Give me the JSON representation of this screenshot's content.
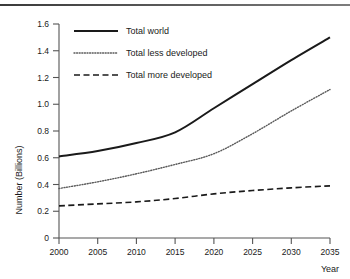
{
  "figure": {
    "has_top_rule": true,
    "background_color": "#ffffff",
    "ink_color": "#1a1a1a"
  },
  "chart_data": {
    "type": "line",
    "title": "",
    "xlabel": "Year",
    "ylabel": "Number (Billions)",
    "x": [
      2000,
      2005,
      2010,
      2015,
      2020,
      2025,
      2030,
      2035
    ],
    "xlim": [
      2000,
      2035
    ],
    "ylim": [
      0,
      1.6
    ],
    "xticks": [
      2000,
      2005,
      2010,
      2015,
      2020,
      2025,
      2030,
      2035
    ],
    "xtick_labels": [
      "2000",
      "2005",
      "2010",
      "2015",
      "2020",
      "2025",
      "2030",
      "2035"
    ],
    "yticks": [
      0,
      0.2,
      0.4,
      0.6,
      0.8,
      1.0,
      1.2,
      1.4,
      1.6
    ],
    "ytick_labels": [
      "0",
      "0.2",
      "0.4",
      "0.6",
      "0.8",
      "1.0",
      "1.2",
      "1.4",
      "1.6"
    ],
    "grid": false,
    "legend_position": "top-left-inside",
    "series": [
      {
        "name": "Total world",
        "style": "solid",
        "color": "#1a1a1a",
        "values": [
          0.61,
          0.65,
          0.71,
          0.79,
          0.97,
          1.15,
          1.33,
          1.5
        ]
      },
      {
        "name": "Total less developed",
        "style": "dotted",
        "color": "#4a4a4a",
        "values": [
          0.37,
          0.42,
          0.48,
          0.55,
          0.63,
          0.78,
          0.95,
          1.11
        ]
      },
      {
        "name": "Total more developed",
        "style": "dashed",
        "color": "#1a1a1a",
        "values": [
          0.24,
          0.255,
          0.27,
          0.295,
          0.33,
          0.355,
          0.375,
          0.39
        ]
      }
    ]
  },
  "legend": {
    "entries": [
      {
        "label": "Total world",
        "style": "solid"
      },
      {
        "label": "Total less developed",
        "style": "dotted"
      },
      {
        "label": "Total more developed",
        "style": "dashed"
      }
    ]
  }
}
